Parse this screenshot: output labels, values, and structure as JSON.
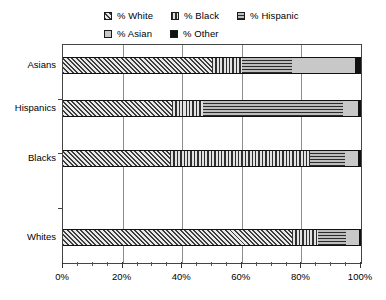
{
  "chart_data": {
    "type": "bar",
    "orientation": "horizontal",
    "stacked": true,
    "normalized": "100%",
    "title": "",
    "xlabel": "",
    "ylabel": "",
    "xlim": [
      0,
      100
    ],
    "grid": true,
    "legend_position": "top",
    "categories": [
      "Asians",
      "Hispanics",
      "Blacks",
      "Whites"
    ],
    "tick_labels": [
      "0%",
      "20%",
      "40%",
      "60%",
      "80%",
      "100%"
    ],
    "tick_values": [
      0,
      20,
      40,
      60,
      80,
      100
    ],
    "minor_tick_step": 5,
    "series": [
      {
        "name": "% White",
        "pattern": "diagonal-hatch",
        "color": "#3d3d3d",
        "values": [
          50.0,
          36.5,
          36.0,
          77.0
        ]
      },
      {
        "name": "% Black",
        "pattern": "vertical-lines",
        "color": "#555555",
        "values": [
          10.0,
          10.5,
          47.0,
          8.5
        ]
      },
      {
        "name": "% Hispanic",
        "pattern": "horizontal-lines",
        "color": "#4a4a4a",
        "values": [
          17.0,
          47.0,
          11.5,
          9.5
        ]
      },
      {
        "name": "% Asian",
        "pattern": "solid-light-gray",
        "color": "#c8c8c8",
        "values": [
          21.0,
          5.0,
          4.5,
          4.5
        ]
      },
      {
        "name": "% Other",
        "pattern": "solid-black",
        "color": "#111111",
        "values": [
          2.0,
          1.0,
          1.0,
          0.5
        ]
      }
    ]
  },
  "legend": {
    "items": [
      {
        "label": "% White",
        "swatch": "diagonal-hatch-swatch"
      },
      {
        "label": "% Black",
        "swatch": "vertical-lines-swatch"
      },
      {
        "label": "% Hispanic",
        "swatch": "horizontal-lines-swatch"
      },
      {
        "label": "% Asian",
        "swatch": "light-gray-swatch"
      },
      {
        "label": "% Other",
        "swatch": "black-swatch"
      }
    ]
  }
}
